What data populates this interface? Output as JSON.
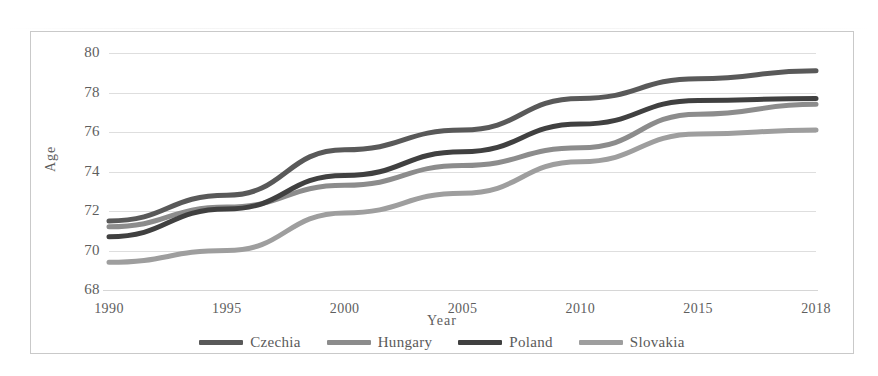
{
  "chart_data": {
    "type": "line",
    "title": "",
    "xlabel": "Year",
    "ylabel": "Age",
    "categories": [
      "1990",
      "1995",
      "2000",
      "2005",
      "2010",
      "2015",
      "2018"
    ],
    "x": [
      1990,
      1995,
      2000,
      2005,
      2010,
      2015,
      2018
    ],
    "ylim": [
      68,
      80
    ],
    "yticks": [
      "68",
      "70",
      "72",
      "74",
      "76",
      "78",
      "80"
    ],
    "ytick_values": [
      68,
      70,
      72,
      74,
      76,
      78,
      80
    ],
    "grid": "horizontal",
    "legend_position": "bottom",
    "series": [
      {
        "name": "Czechia",
        "color": "#595959",
        "values": [
          71.5,
          72.8,
          75.1,
          76.1,
          77.7,
          78.7,
          79.1
        ]
      },
      {
        "name": "Hungary",
        "color": "#8c8c8c",
        "values": [
          71.2,
          72.2,
          73.3,
          74.3,
          75.2,
          76.9,
          77.4
        ]
      },
      {
        "name": "Poland",
        "color": "#404040",
        "values": [
          70.7,
          72.1,
          73.8,
          75.0,
          76.4,
          77.6,
          77.7
        ]
      },
      {
        "name": "Slovakia",
        "color": "#9e9e9e",
        "values": [
          69.4,
          70.0,
          71.9,
          72.9,
          74.5,
          75.9,
          76.1
        ]
      }
    ]
  },
  "axes": {
    "y_title": "Age",
    "x_title": "Year"
  },
  "colors": {
    "gridline": "#dedede",
    "border": "#c9c9c9",
    "tick_text": "#5e5e5e",
    "background": "#ffffff"
  }
}
